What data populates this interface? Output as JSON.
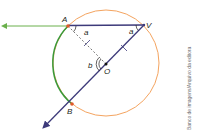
{
  "diagram": {
    "type": "geometry-circle-inscribed-angle",
    "points": {
      "A": {
        "label": "A",
        "x": 68,
        "y": 26
      },
      "V": {
        "label": "V",
        "x": 144,
        "y": 25
      },
      "O": {
        "label": "O",
        "x": 106,
        "y": 64
      },
      "B": {
        "label": "B",
        "x": 72,
        "y": 104
      }
    },
    "angles": {
      "angle_at_A": "a",
      "angle_at_V": "a",
      "angle_at_O": "b"
    },
    "circle": {
      "cx": 106,
      "cy": 63,
      "r": 53
    },
    "colors": {
      "circle": "#f4a460",
      "arc_AB": "#3a9a3a",
      "chord": "#3d3a7a",
      "ray_left": "#6ab04c",
      "point": "#e05a2b",
      "dashed": "#555555"
    }
  },
  "credit": "Banco de imagens/Arquivo da editora"
}
